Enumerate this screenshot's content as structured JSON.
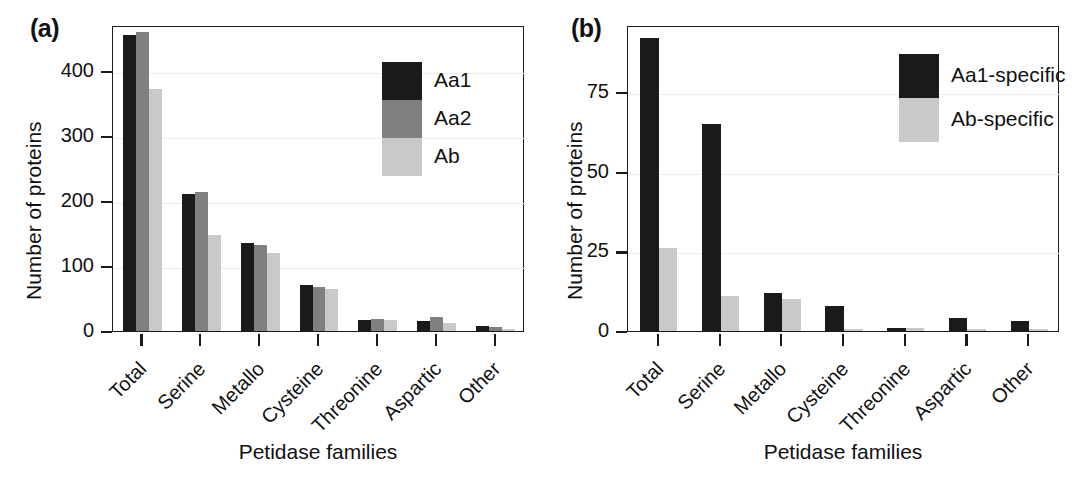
{
  "figure": {
    "panels": [
      {
        "tag": "(a)",
        "ylabel": "Number of proteins",
        "xlabel": "Petidase families",
        "yticks": [
          "0",
          "100",
          "200",
          "300",
          "400"
        ],
        "legend": [
          "Aa1",
          "Aa2",
          "Ab"
        ]
      },
      {
        "tag": "(b)",
        "ylabel": "Number of proteins",
        "xlabel": "Petidase families",
        "yticks": [
          "0",
          "25",
          "50",
          "75"
        ],
        "legend": [
          "Aa1-specific",
          "Ab-specific"
        ]
      }
    ]
  },
  "colors": {
    "series_dark": "#1a1a1a",
    "series_mid": "#808080",
    "series_light": "#c9c9c9",
    "axis": "#1a1a1a",
    "grid": "#ececec",
    "background": "#ffffff"
  },
  "chart_data": [
    {
      "type": "bar",
      "title": "(a)",
      "xlabel": "Petidase families",
      "ylabel": "Number of proteins",
      "categories": [
        "Total",
        "Serine",
        "Metallo",
        "Cysteine",
        "Threonine",
        "Aspartic",
        "Other"
      ],
      "series": [
        {
          "name": "Aa1",
          "color": "#1a1a1a",
          "values": [
            455,
            210,
            135,
            70,
            17,
            15,
            7
          ]
        },
        {
          "name": "Aa2",
          "color": "#808080",
          "values": [
            460,
            213,
            132,
            68,
            18,
            21,
            6
          ]
        },
        {
          "name": "Ab",
          "color": "#c9c9c9",
          "values": [
            372,
            147,
            120,
            65,
            17,
            12,
            2
          ]
        }
      ],
      "ylim": [
        0,
        470
      ],
      "yticks": [
        0,
        100,
        200,
        300,
        400
      ],
      "grid": true,
      "legend_position": "top-right"
    },
    {
      "type": "bar",
      "title": "(b)",
      "xlabel": "Petidase families",
      "ylabel": "Number of proteins",
      "categories": [
        "Total",
        "Serine",
        "Metallo",
        "Cysteine",
        "Threonine",
        "Aspartic",
        "Other"
      ],
      "series": [
        {
          "name": "Aa1-specific",
          "color": "#1a1a1a",
          "values": [
            92,
            65,
            12,
            8,
            1,
            4,
            3
          ]
        },
        {
          "name": "Ab-specific",
          "color": "#c9c9c9",
          "values": [
            26,
            11,
            10,
            0.2,
            1,
            0.6,
            0.2
          ]
        }
      ],
      "ylim": [
        0,
        96
      ],
      "yticks": [
        0,
        25,
        50,
        75
      ],
      "grid": true,
      "legend_position": "top-right"
    }
  ]
}
